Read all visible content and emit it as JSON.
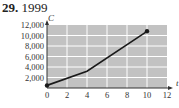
{
  "problem": {
    "number": "29.",
    "answer": "1999"
  },
  "colors": {
    "plot_bg": "#c2c2c2",
    "grid": "#ffffff",
    "line": "#1a1a1a"
  },
  "chart_data": {
    "type": "line",
    "title": "",
    "xlabel": "t",
    "ylabel": "C",
    "x_ticks": [
      "0",
      "2",
      "4",
      "6",
      "8",
      "10",
      "12"
    ],
    "y_ticks": [
      "2,000",
      "4,000",
      "6,000",
      "8,000",
      "10,000",
      "12,000"
    ],
    "xlim": [
      0,
      12
    ],
    "ylim": [
      0,
      12000
    ],
    "grid": true,
    "legend": null,
    "series": [
      {
        "name": "C",
        "x": [
          0,
          4,
          10
        ],
        "y": [
          500,
          3200,
          10800
        ],
        "endpoints_marked": true
      }
    ]
  }
}
